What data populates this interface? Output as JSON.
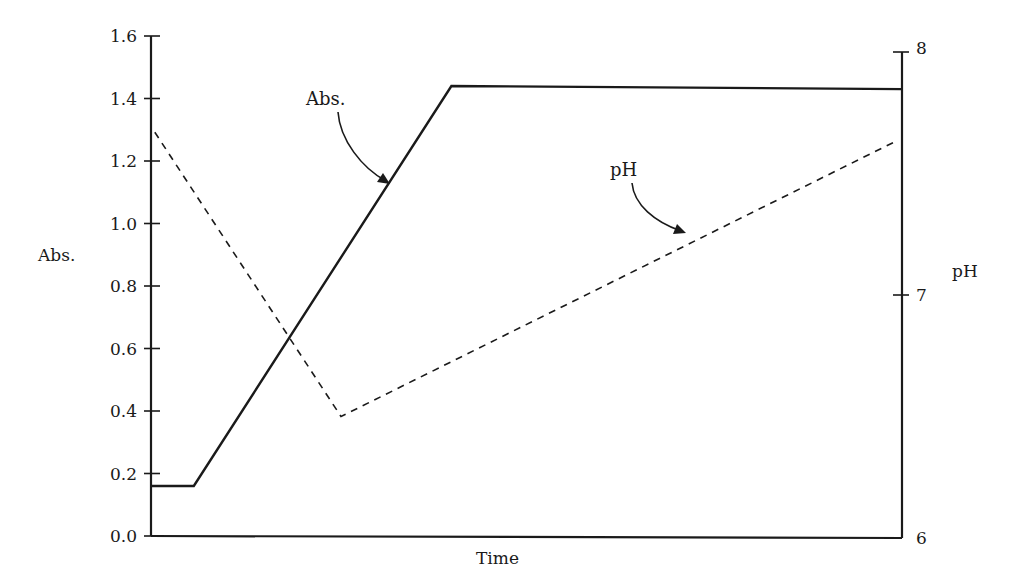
{
  "chart_data": {
    "type": "line",
    "title": "",
    "xlabel": "Time",
    "ylabel": "Abs.",
    "y2label": "pH",
    "ylim": [
      0.0,
      1.6
    ],
    "y2lim": [
      6,
      8
    ],
    "xlim": [
      0,
      100
    ],
    "grid": false,
    "legend": "none (inline arrow annotations)",
    "yticks": [
      "0.0",
      "0.2",
      "0.4",
      "0.6",
      "0.8",
      "1.0",
      "1.2",
      "1.4",
      "1.6"
    ],
    "y2ticks": [
      "6",
      "7",
      "8"
    ],
    "series": [
      {
        "name": "Abs.",
        "axis": "left",
        "style": "solid",
        "x": [
          0,
          5.7,
          40,
          100
        ],
        "values": [
          0.16,
          0.16,
          1.44,
          1.43
        ]
      },
      {
        "name": "pH",
        "axis": "right",
        "style": "dashed",
        "x": [
          0.5,
          25.3,
          99
        ],
        "values": [
          7.67,
          6.5,
          7.63
        ]
      }
    ],
    "annotations": [
      {
        "text": "Abs.",
        "points_to": "Abs. series rising segment"
      },
      {
        "text": "pH",
        "points_to": "pH series rising segment"
      }
    ]
  },
  "labels": {
    "left_axis_title": "Abs.",
    "right_axis_title": "pH",
    "x_axis_title": "Time",
    "annot_abs": "Abs.",
    "annot_ph": "pH"
  }
}
